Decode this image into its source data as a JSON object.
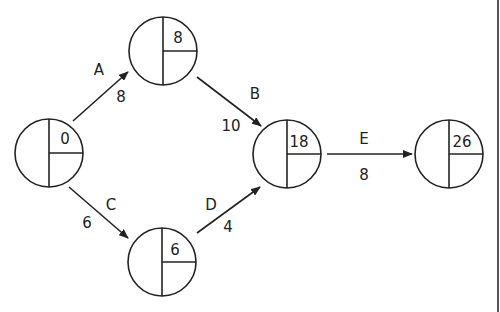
{
  "diagram": {
    "type": "activity-on-arrow network",
    "nodes": [
      {
        "id": "n1",
        "earliest": "0",
        "cx": 49,
        "cy": 153
      },
      {
        "id": "n2",
        "earliest": "8",
        "cx": 163,
        "cy": 51
      },
      {
        "id": "n3",
        "earliest": "6",
        "cx": 162,
        "cy": 262
      },
      {
        "id": "n4",
        "earliest": "18",
        "cx": 287,
        "cy": 154
      },
      {
        "id": "n5",
        "earliest": "26",
        "cx": 449,
        "cy": 154
      }
    ],
    "activities": [
      {
        "name": "A",
        "duration": "8",
        "from": "n1",
        "to": "n2"
      },
      {
        "name": "B",
        "duration": "10",
        "from": "n2",
        "to": "n4"
      },
      {
        "name": "C",
        "duration": "6",
        "from": "n1",
        "to": "n3"
      },
      {
        "name": "D",
        "duration": "4",
        "from": "n3",
        "to": "n4"
      },
      {
        "name": "E",
        "duration": "8",
        "from": "n4",
        "to": "n5"
      }
    ],
    "colors": {
      "stroke": "#222222",
      "background": "#ffffff"
    }
  }
}
